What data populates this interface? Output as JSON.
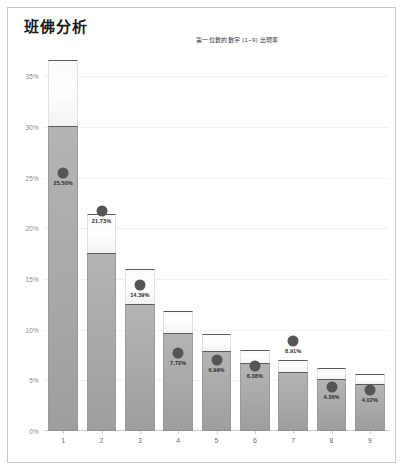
{
  "header": {
    "title": "班佛分析"
  },
  "chart_data": {
    "type": "bar",
    "title": "班佛分析",
    "subtitle": "第一位數的數字 (1~9) 出現率",
    "xlabel": "",
    "ylabel": "",
    "grid": true,
    "legend": null,
    "xlim": [
      0.5,
      9.5
    ],
    "ylim": [
      0,
      37
    ],
    "categories": [
      "1",
      "2",
      "3",
      "4",
      "5",
      "6",
      "7",
      "8",
      "9"
    ],
    "ytick_labels": [
      "0%",
      "5%",
      "10%",
      "15%",
      "20%",
      "25%",
      "30%",
      "35%"
    ],
    "ytick_values": [
      0,
      5,
      10,
      15,
      20,
      25,
      30,
      35
    ],
    "series": [
      {
        "name": "上限",
        "role": "upper-box-top",
        "values": [
          36.6,
          21.4,
          16.0,
          11.8,
          9.6,
          8.0,
          7.0,
          6.2,
          5.6
        ]
      },
      {
        "name": "下限",
        "role": "lower-box-top",
        "values": [
          30.1,
          17.6,
          12.5,
          9.7,
          7.9,
          6.7,
          5.8,
          5.1,
          4.6
        ]
      },
      {
        "name": "實際出現率",
        "role": "marker",
        "values": [
          25.5,
          21.73,
          14.39,
          7.72,
          6.99,
          6.38,
          8.91,
          4.36,
          4.02
        ],
        "labels": [
          "25.50%",
          "21.73%",
          "14.39%",
          "7.72%",
          "6.99%",
          "6.38%",
          "8.91%",
          "4.36%",
          "4.02%"
        ]
      }
    ],
    "colors": {
      "upper_box": "#ffffff",
      "lower_box": "#aaaaaa",
      "box_edge": "#5c5c5c",
      "marker": "#555555",
      "grid": "#f2f2f2",
      "axis": "#cfcfcf",
      "border": "#c9c9c9"
    }
  }
}
